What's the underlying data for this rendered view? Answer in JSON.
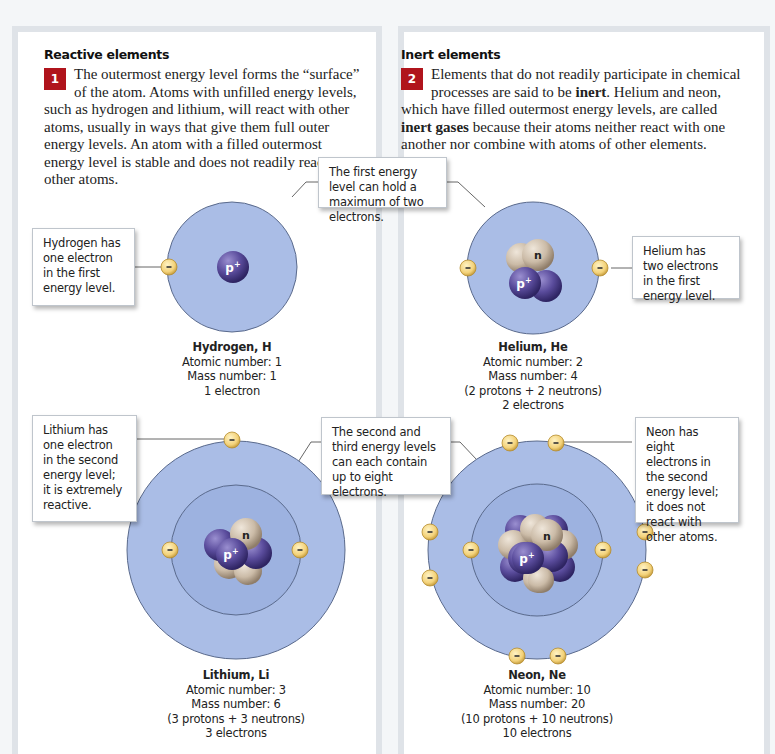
{
  "panels": {
    "left": {
      "heading": "Reactive elements",
      "number": "1",
      "text": "The outermost energy level forms the “surface” of the atom. Atoms with unfilled energy levels, such as hydrogen and lithium, will react with other atoms, usually in ways that give them full outer energy levels. An atom with a filled outermost energy level is stable and does not readily react with other atoms."
    },
    "right": {
      "heading": "Inert elements",
      "number": "2",
      "text_parts": {
        "a": "Elements that do not readily participate in chemical processes are said to be ",
        "b": "inert",
        "c": ". Helium and neon, which have filled outermost energy levels, are called ",
        "d": "inert gases",
        "e": " because their atoms neither react with one another nor combine with atoms of other elements."
      }
    }
  },
  "callouts": {
    "hydrogen": "Hydrogen has one electron in the first energy level.",
    "first_level": "The first energy level can hold a maximum of two electrons.",
    "helium": "Helium has two electrons in the first energy level.",
    "lithium": "Lithium has one electron in the second energy level; it is extremely reactive.",
    "second_third_level": "The second and third energy levels can each contain up to eight electrons.",
    "neon": "Neon has eight electrons in the second energy level; it does not react with other atoms."
  },
  "atoms": {
    "hydrogen": {
      "name": "Hydrogen, H",
      "atomic": "Atomic number: 1",
      "mass": "Mass number: 1",
      "electrons": "1 electron"
    },
    "helium": {
      "name": "Helium, He",
      "atomic": "Atomic number: 2",
      "mass": "Mass number: 4",
      "composition": "(2 protons + 2 neutrons)",
      "electrons": "2 electrons"
    },
    "lithium": {
      "name": "Lithium, Li",
      "atomic": "Atomic number: 3",
      "mass": "Mass number: 6",
      "composition": "(3 protons + 3 neutrons)",
      "electrons": "3 electrons"
    },
    "neon": {
      "name": "Neon, Ne",
      "atomic": "Atomic number: 10",
      "mass": "Mass number: 20",
      "composition": "(10 protons + 10 neutrons)",
      "electrons": "10 electrons"
    }
  },
  "labels": {
    "proton": "p+",
    "neutron": "n",
    "electron": "–"
  },
  "colors": {
    "shell_outer": "#aabde6",
    "shell_inner": "#9db2e0",
    "proton": "#5a4c9c",
    "neutron": "#cfc0ad",
    "electron": "#f3d27a",
    "number_badge": "#b0141c"
  }
}
